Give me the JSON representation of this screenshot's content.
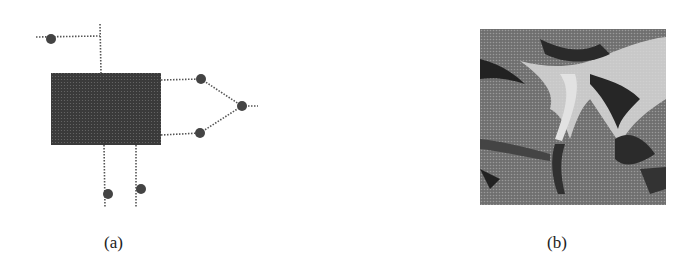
{
  "figure": {
    "panels": [
      {
        "id": "a",
        "label": "(a)",
        "type": "schematic",
        "description": "Dark rectangular block with dotted connection lines terminating in round nodes",
        "colors": {
          "block": "#3a3a3a",
          "node": "#444444",
          "line": "#555555"
        },
        "block": {
          "x": 51,
          "y": 73,
          "w": 110,
          "h": 72
        },
        "nodes": [
          {
            "name": "top-left-node",
            "x": 51,
            "y": 39
          },
          {
            "name": "upper-right-node",
            "x": 201,
            "y": 79
          },
          {
            "name": "apex-node",
            "x": 242,
            "y": 106
          },
          {
            "name": "lower-right-node",
            "x": 200,
            "y": 133
          },
          {
            "name": "bottom-left-node",
            "x": 108,
            "y": 194
          },
          {
            "name": "bottom-right-node",
            "x": 141,
            "y": 189
          }
        ]
      },
      {
        "id": "b",
        "label": "(b)",
        "type": "halftone-image",
        "description": "Grayscale halftone terrain/texture image with branching light and dark regions"
      }
    ]
  }
}
